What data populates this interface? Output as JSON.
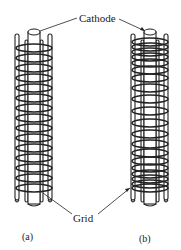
{
  "labels": {
    "cathode": "Cathode",
    "grid": "Grid"
  },
  "captions": {
    "a": "(a)",
    "b": "(b)"
  },
  "structures": [
    {
      "id": "a",
      "description": "Cylindrical grid with uniformly spaced helical wire around central cathode",
      "coil_spacing": "uniform"
    },
    {
      "id": "b",
      "description": "Cylindrical grid with variable pitch helical wire (tighter at ends) around central cathode",
      "coil_spacing": "variable"
    }
  ],
  "colors": {
    "ink": "#222222",
    "background": "#ffffff"
  }
}
